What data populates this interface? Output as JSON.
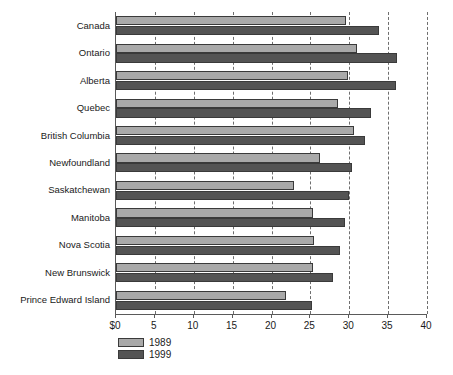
{
  "chart_data": {
    "type": "bar",
    "orientation": "horizontal",
    "title": "",
    "subtitle": "",
    "xlabel": "",
    "ylabel": "",
    "xlim": [
      0,
      40
    ],
    "xticks": [
      0,
      5,
      10,
      15,
      20,
      25,
      30,
      35,
      40
    ],
    "xtick_labels": [
      "$0",
      "5",
      "10",
      "15",
      "20",
      "25",
      "30",
      "35",
      "40"
    ],
    "grid": true,
    "grid_axis": "x",
    "grid_style": "dashed",
    "legend_position": "below-left",
    "categories": [
      "Canada",
      "Ontario",
      "Alberta",
      "Quebec",
      "British Columbia",
      "Newfoundland",
      "Saskatchewan",
      "Manitoba",
      "Nova Scotia",
      "New Brunswick",
      "Prince Edward Island"
    ],
    "series": [
      {
        "name": "1989",
        "color": "#a9a9a9",
        "values": [
          29.6,
          31.0,
          29.8,
          28.6,
          30.6,
          26.2,
          22.9,
          25.3,
          25.5,
          25.4,
          21.9
        ]
      },
      {
        "name": "1999",
        "color": "#545454",
        "values": [
          33.8,
          36.2,
          36.0,
          32.8,
          32.0,
          30.3,
          30.0,
          29.4,
          28.8,
          27.9,
          25.2
        ]
      }
    ]
  },
  "legend": {
    "entries": [
      {
        "label": "1989",
        "color": "#a9a9a9"
      },
      {
        "label": "1999",
        "color": "#545454"
      }
    ]
  },
  "colors": {
    "series_1989": "#a9a9a9",
    "series_1999": "#545454",
    "axis": "#5a5a5a",
    "grid": "#6e6e6e",
    "text": "#1a1a1a",
    "background": "#ffffff"
  }
}
